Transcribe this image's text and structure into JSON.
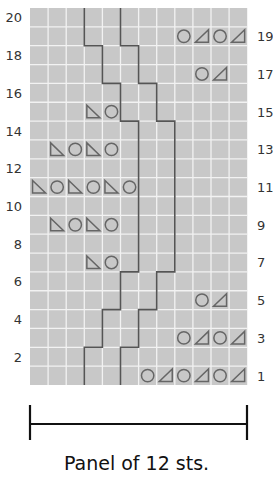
{
  "chart": {
    "stitches": 12,
    "rows": 20,
    "grid_color": "#c8c8c8",
    "gridline_color": "#f2f2f2",
    "line_color": "#555555",
    "symbol_color": "#666666",
    "row_labels_left": [
      "2",
      "4",
      "6",
      "8",
      "10",
      "12",
      "14",
      "16",
      "18",
      "20"
    ],
    "row_labels_right": [
      "1",
      "3",
      "5",
      "7",
      "9",
      "11",
      "13",
      "15",
      "17",
      "19"
    ],
    "symbols_legend": {
      "O": "yarn over (circle)",
      "L": "left-leaning triangle (ssk)",
      "R": "right-leaning triangle (k2tog)"
    },
    "symbol_rows": [
      {
        "row": 1,
        "start_col": 6,
        "symbols": [
          "O",
          "R",
          "O",
          "R",
          "O",
          "R"
        ]
      },
      {
        "row": 3,
        "start_col": 8,
        "symbols": [
          "O",
          "R",
          "O",
          "R"
        ]
      },
      {
        "row": 5,
        "start_col": 9,
        "symbols": [
          "O",
          "R"
        ]
      },
      {
        "row": 7,
        "start_col": 3,
        "symbols": [
          "L",
          "O"
        ]
      },
      {
        "row": 9,
        "start_col": 1,
        "symbols": [
          "L",
          "O",
          "L",
          "O"
        ]
      },
      {
        "row": 11,
        "start_col": 0,
        "symbols": [
          "L",
          "O",
          "L",
          "O",
          "L",
          "O"
        ]
      },
      {
        "row": 13,
        "start_col": 1,
        "symbols": [
          "L",
          "O",
          "L",
          "O"
        ]
      },
      {
        "row": 15,
        "start_col": 3,
        "symbols": [
          "L",
          "O"
        ]
      },
      {
        "row": 17,
        "start_col": 9,
        "symbols": [
          "O",
          "R"
        ]
      },
      {
        "row": 19,
        "start_col": 8,
        "symbols": [
          "O",
          "R",
          "O",
          "R"
        ]
      }
    ],
    "cable_lines": [
      {
        "name": "left-line",
        "x_by_rows": [
          [
            1,
            2,
            3
          ],
          [
            3,
            4,
            4
          ],
          [
            5,
            6,
            5
          ],
          [
            7,
            14,
            6
          ],
          [
            15,
            16,
            5
          ],
          [
            17,
            18,
            4
          ],
          [
            19,
            20,
            3
          ]
        ]
      },
      {
        "name": "right-line",
        "x_by_rows": [
          [
            1,
            2,
            5
          ],
          [
            3,
            4,
            6
          ],
          [
            5,
            6,
            7
          ],
          [
            7,
            14,
            8
          ],
          [
            15,
            16,
            7
          ],
          [
            17,
            18,
            6
          ],
          [
            19,
            20,
            5
          ]
        ]
      }
    ]
  },
  "panel": {
    "caption": "Panel of 12 sts."
  }
}
